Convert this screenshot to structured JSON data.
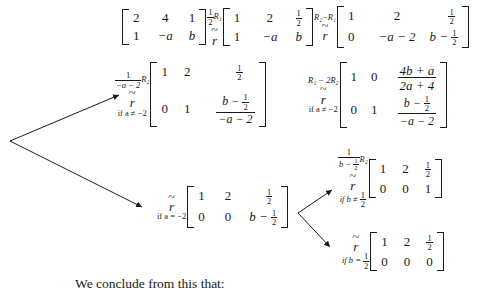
{
  "page": {
    "conclusion_text": "We conclude from this that:",
    "equivalence_symbol": "r",
    "tilde": "~"
  },
  "steps": [
    {
      "id": "start",
      "operation_label": "",
      "condition": "",
      "matrix": [
        [
          "2",
          "4",
          "1"
        ],
        [
          "1",
          "−a",
          "b"
        ]
      ]
    },
    {
      "id": "half-r1",
      "operation_numerator": "1",
      "operation_denominator": "2",
      "operation_label": "R₁",
      "condition": "",
      "matrix_row1": [
        "1",
        "2"
      ],
      "matrix": [
        [
          "1",
          "2",
          "1/2"
        ],
        [
          "1",
          "−a",
          "b"
        ]
      ]
    },
    {
      "id": "r2-minus-r1",
      "operation_label": "R₂ − R₁",
      "condition": "",
      "matrix": [
        [
          "1",
          "2",
          "1/2"
        ],
        [
          "0",
          "−a − 2",
          "b − 1/2"
        ]
      ]
    },
    {
      "id": "scale-r2",
      "operation_label": "R₂",
      "operation_frac_num": "1",
      "operation_frac_den": "−a − 2",
      "condition": "if a ≠ −2",
      "matrix": [
        [
          "1",
          "2",
          "1/2"
        ],
        [
          "0",
          "1",
          "(b − 1/2)/(−a − 2)"
        ]
      ]
    },
    {
      "id": "r1-minus-2r2",
      "operation_label": "R₁ − 2R₂",
      "condition": "if a ≠ −2",
      "matrix": [
        [
          "1",
          "0",
          "(4b + a)/(2a + 4)"
        ],
        [
          "0",
          "1",
          "(b − 1/2)/(−a − 2)"
        ]
      ]
    },
    {
      "id": "case-a-eq-neg2",
      "operation_label": "",
      "condition": "if a = −2",
      "matrix": [
        [
          "1",
          "2",
          "1/2"
        ],
        [
          "0",
          "0",
          "b − 1/2"
        ]
      ]
    },
    {
      "id": "case-b-neq-half",
      "operation_label": "R₂",
      "operation_frac_num": "1",
      "operation_frac_den": "b − 1/2",
      "condition": "if b ≠ 1/2",
      "matrix": [
        [
          "1",
          "2",
          "1/2"
        ],
        [
          "0",
          "0",
          "1"
        ]
      ]
    },
    {
      "id": "case-b-eq-half",
      "operation_label": "",
      "condition": "if b = 1/2",
      "matrix": [
        [
          "1",
          "2",
          "1/2"
        ],
        [
          "0",
          "0",
          "0"
        ]
      ]
    }
  ],
  "labels": {
    "two": "2",
    "four": "4",
    "one": "1",
    "zero": "0",
    "neg_a": "−a",
    "b": "b",
    "half_num": "1",
    "half_den": "2",
    "neg_a_minus_2": "−a − 2",
    "b_minus_half_lead": "b −",
    "four_b_plus_a": "4b + a",
    "two_a_plus_4": "2a + 4",
    "R1": "R₁",
    "R2": "R₂",
    "R2_minus_R1": "R₂−R₁",
    "R1_minus_2R2": "R₁ − 2R₂",
    "cond_a_neq": "if a ≠ −2",
    "cond_a_eq": "if a = −2",
    "cond_b_neq": "if b ≠",
    "cond_b_eq": "if b =",
    "neg_a_minus_2_den": "−a − 2",
    "b_minus_half_den": "b −"
  },
  "colors": {
    "ink": "#1a1a1a",
    "paper": "#ffffff"
  }
}
